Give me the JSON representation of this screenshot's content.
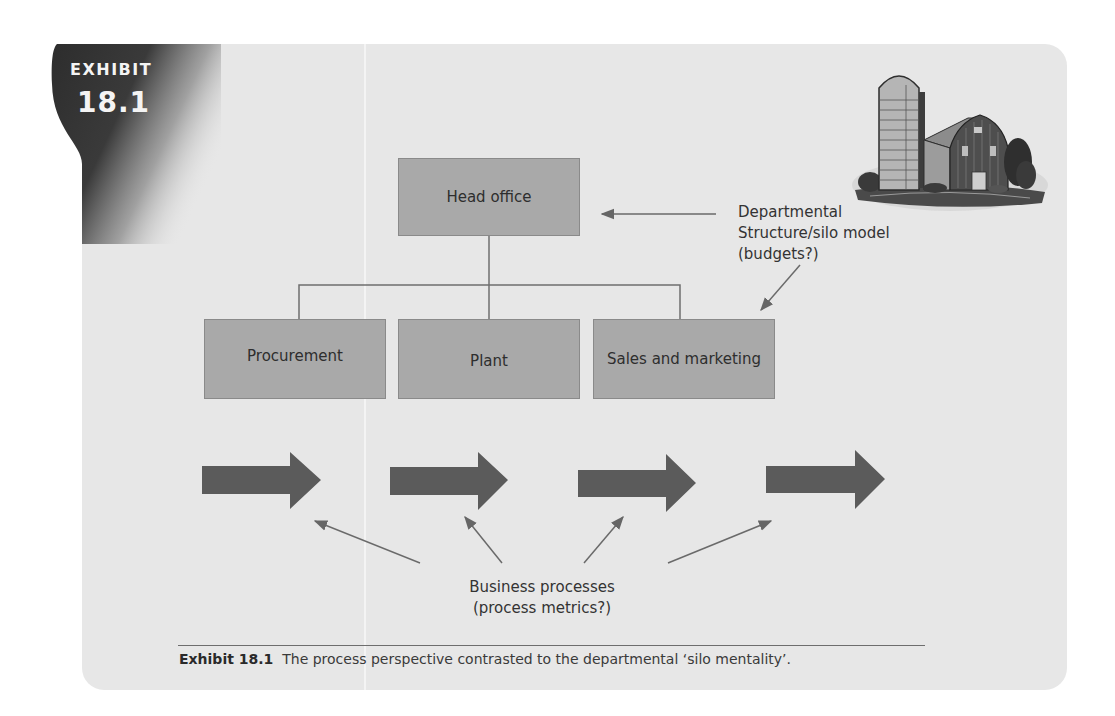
{
  "exhibit_tab": {
    "label": "EXHIBIT",
    "number": "18.1"
  },
  "colors": {
    "panel_background": "#e7e7e7",
    "box_fill": "#a9a9a9",
    "box_border": "#8a8a8a",
    "arrow_fill": "#5b5b5b",
    "line_color": "#6a6a6a",
    "tab_dark": "#2f2f2f"
  },
  "diagram": {
    "head_office": {
      "label": "Head office"
    },
    "departments": [
      {
        "label": "Procurement"
      },
      {
        "label": "Plant"
      },
      {
        "label": "Sales and marketing"
      }
    ],
    "departmental_note": {
      "lines": [
        "Departmental",
        "Structure/silo model",
        "(budgets?)"
      ]
    },
    "process_arrows_count": 4,
    "process_note": {
      "lines": [
        "Business processes",
        "(process metrics?)"
      ]
    },
    "illustration": "barn-and-silo-engraving"
  },
  "caption": {
    "label": "Exhibit 18.1",
    "text": "The process perspective contrasted to the departmental ‘silo mentality’."
  }
}
